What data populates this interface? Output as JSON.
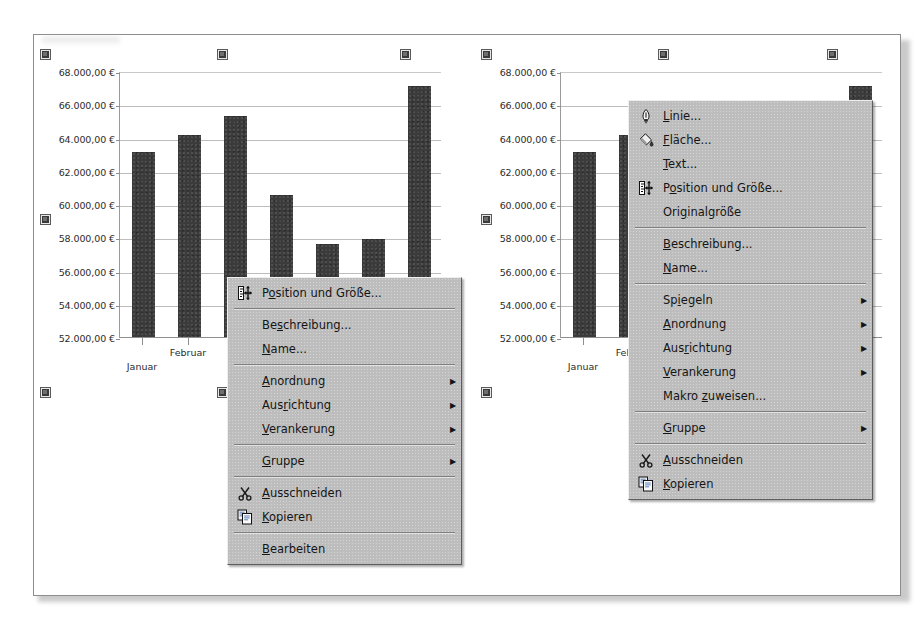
{
  "document": {
    "app": "LibreOffice Calc - chart object context menus",
    "background_color": "#ffffff",
    "sheet_color": "#ffffff"
  },
  "chart_data": [
    {
      "id": "left-chart",
      "type": "bar",
      "title": "",
      "xlabel": "",
      "ylabel": "",
      "categories": [
        "Januar",
        "Februar",
        "März",
        "April",
        "Mai",
        "Juni",
        "Juli"
      ],
      "visible_category_labels": [
        "Januar",
        "Februar",
        "Mä"
      ],
      "values": [
        63150,
        64150,
        65300,
        60550,
        57600,
        57900,
        67100
      ],
      "ylim": [
        52000,
        68000
      ],
      "ytick_values": [
        68000,
        66000,
        64000,
        62000,
        60000,
        58000,
        56000,
        54000,
        52000
      ],
      "ytick_labels": [
        "68.000,00 €",
        "66.000,00 €",
        "64.000,00 €",
        "62.000,00 €",
        "60.000,00 €",
        "58.000,00 €",
        "56.000,00 €",
        "54.000,00 €",
        "52.000,00 €"
      ],
      "grid": true,
      "legend": "none",
      "bar_color": "#3b3b3b"
    },
    {
      "id": "right-chart",
      "type": "bar",
      "title": "",
      "xlabel": "",
      "ylabel": "",
      "categories": [
        "Januar",
        "Februar",
        "März",
        "April",
        "Mai",
        "Juni",
        "Juli"
      ],
      "visible_category_labels": [
        "Januar",
        "Febru"
      ],
      "values": [
        63150,
        64150,
        65300,
        60550,
        57600,
        57900,
        67100
      ],
      "ylim": [
        52000,
        68000
      ],
      "ytick_values": [
        68000,
        66000,
        64000,
        62000,
        60000,
        58000,
        56000,
        54000,
        52000
      ],
      "ytick_labels": [
        "68.000,00 €",
        "66.000,00 €",
        "64.000,00 €",
        "62.000,00 €",
        "60.000,00 €",
        "58.000,00 €",
        "56.000,00 €",
        "54.000,00 €",
        "52.000,00 €"
      ],
      "grid": true,
      "legend": "none",
      "bar_color": "#3b3b3b",
      "occluded_by_menu": true
    }
  ],
  "context_menu_left": {
    "name": "object-context-menu-short",
    "items": [
      {
        "kind": "item",
        "label": "Position und Größe...",
        "accel": "o",
        "icon": "position-and-size-icon"
      },
      {
        "kind": "separator"
      },
      {
        "kind": "item",
        "label": "Beschreibung...",
        "accel": "s",
        "icon": "none"
      },
      {
        "kind": "item",
        "label": "Name...",
        "accel": "N",
        "icon": "none"
      },
      {
        "kind": "separator"
      },
      {
        "kind": "submenu",
        "label": "Anordnung",
        "accel": "A",
        "icon": "none"
      },
      {
        "kind": "submenu",
        "label": "Ausrichtung",
        "accel": "r",
        "icon": "none"
      },
      {
        "kind": "submenu",
        "label": "Verankerung",
        "accel": "V",
        "icon": "none"
      },
      {
        "kind": "separator"
      },
      {
        "kind": "submenu",
        "label": "Gruppe",
        "accel": "G",
        "icon": "none"
      },
      {
        "kind": "separator"
      },
      {
        "kind": "item",
        "label": "Ausschneiden",
        "accel": "A",
        "icon": "scissors-icon"
      },
      {
        "kind": "item",
        "label": "Kopieren",
        "accel": "K",
        "icon": "copy-icon"
      },
      {
        "kind": "separator"
      },
      {
        "kind": "item",
        "label": "Bearbeiten",
        "accel": "B",
        "icon": "none"
      }
    ]
  },
  "context_menu_right": {
    "name": "object-context-menu-full",
    "items": [
      {
        "kind": "item",
        "label": "Linie...",
        "accel": "L",
        "icon": "pen-nib-icon"
      },
      {
        "kind": "item",
        "label": "Fläche...",
        "accel": "F",
        "icon": "paint-bucket-icon"
      },
      {
        "kind": "item",
        "label": "Text...",
        "accel": "T",
        "icon": "none"
      },
      {
        "kind": "item",
        "label": "Position und Größe...",
        "accel": "o",
        "icon": "position-and-size-icon"
      },
      {
        "kind": "item",
        "label": "Originalgröße",
        "accel": "g",
        "icon": "none"
      },
      {
        "kind": "separator"
      },
      {
        "kind": "item",
        "label": "Beschreibung...",
        "accel": "B",
        "icon": "none"
      },
      {
        "kind": "item",
        "label": "Name...",
        "accel": "N",
        "icon": "none"
      },
      {
        "kind": "separator"
      },
      {
        "kind": "submenu",
        "label": "Spiegeln",
        "accel": "i",
        "icon": "none"
      },
      {
        "kind": "submenu",
        "label": "Anordnung",
        "accel": "A",
        "icon": "none"
      },
      {
        "kind": "submenu",
        "label": "Ausrichtung",
        "accel": "r",
        "icon": "none"
      },
      {
        "kind": "submenu",
        "label": "Verankerung",
        "accel": "V",
        "icon": "none"
      },
      {
        "kind": "item",
        "label": "Makro zuweisen...",
        "accel": "z",
        "icon": "none"
      },
      {
        "kind": "separator"
      },
      {
        "kind": "submenu",
        "label": "Gruppe",
        "accel": "G",
        "icon": "none"
      },
      {
        "kind": "separator"
      },
      {
        "kind": "item",
        "label": "Ausschneiden",
        "accel": "A",
        "icon": "scissors-icon"
      },
      {
        "kind": "item",
        "label": "Kopieren",
        "accel": "K",
        "icon": "copy-icon"
      }
    ]
  },
  "selection_handles": {
    "color": "#3a3a3a",
    "left_chart": [
      {
        "x": 41,
        "y": 50
      },
      {
        "x": 218,
        "y": 50
      },
      {
        "x": 401,
        "y": 50
      },
      {
        "x": 41,
        "y": 215
      },
      {
        "x": 401,
        "y": 215
      },
      {
        "x": 41,
        "y": 388
      },
      {
        "x": 218,
        "y": 388
      },
      {
        "x": 401,
        "y": 388
      }
    ],
    "right_chart": [
      {
        "x": 482,
        "y": 50
      },
      {
        "x": 659,
        "y": 50
      },
      {
        "x": 828,
        "y": 50
      },
      {
        "x": 482,
        "y": 215
      },
      {
        "x": 828,
        "y": 215
      },
      {
        "x": 482,
        "y": 388
      },
      {
        "x": 659,
        "y": 388
      },
      {
        "x": 828,
        "y": 388
      }
    ]
  }
}
